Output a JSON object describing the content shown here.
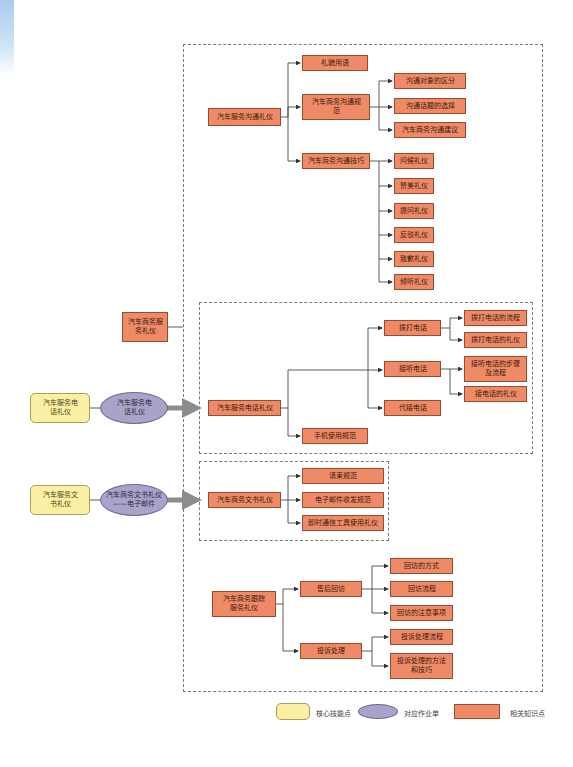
{
  "root": {
    "label": "汽车商务服务礼仪"
  },
  "core_skills": [
    {
      "label": "汽车服务电话礼仪",
      "worksheet": "汽车服务电话礼仪"
    },
    {
      "label": "汽车服务文书礼仪",
      "worksheet": "汽车商务文书礼仪——电子邮件"
    }
  ],
  "sections": {
    "communication": {
      "label": "汽车服务沟通礼仪",
      "children": [
        {
          "label": "礼貌用语"
        },
        {
          "label": "汽车商务沟通规范",
          "children": [
            "沟通对象的区分",
            "沟通话题的选择",
            "汽车商务沟通建议"
          ]
        },
        {
          "label": "汽车商务沟通技巧",
          "children": [
            "问候礼仪",
            "赞美礼仪",
            "提问礼仪",
            "反驳礼仪",
            "致歉礼仪",
            "倾听礼仪"
          ]
        }
      ]
    },
    "phone": {
      "label": "汽车服务电话礼仪",
      "children": [
        {
          "label": "拨打电话",
          "children": [
            "拨打电话的流程",
            "拨打电话的礼仪"
          ]
        },
        {
          "label": "接听电话",
          "children": [
            "接听电话的步骤及流程",
            "接电话的礼仪"
          ]
        },
        {
          "label": "代接电话"
        },
        {
          "label": "手机使用规范"
        }
      ]
    },
    "document": {
      "label": "汽车商务文书礼仪",
      "children": [
        {
          "label": "请柬规范"
        },
        {
          "label": "电子邮件收发规范"
        },
        {
          "label": "即时通信工具使用礼仪"
        }
      ]
    },
    "followup": {
      "label": "汽车商务跟踪服务礼仪",
      "children": [
        {
          "label": "售后回访",
          "children": [
            "回访的方式",
            "回访流程",
            "回访的注意事项"
          ]
        },
        {
          "label": "投诉处理",
          "children": [
            "投诉处理流程",
            "投诉处理的方法和技巧"
          ]
        }
      ]
    }
  },
  "legend": [
    {
      "shape": "rounded-rect",
      "color": "#fbf0a2",
      "label": "核心技能点"
    },
    {
      "shape": "ellipse",
      "color": "#a9a3c9",
      "label": "对应作业单"
    },
    {
      "shape": "rect",
      "color": "#ee8a66",
      "label": "相关知识点"
    }
  ],
  "colors": {
    "knowledge": "#ee8a66",
    "core": "#fbf0a2",
    "worksheet": "#a9a3c9",
    "arrow": "#8c8c8c"
  }
}
